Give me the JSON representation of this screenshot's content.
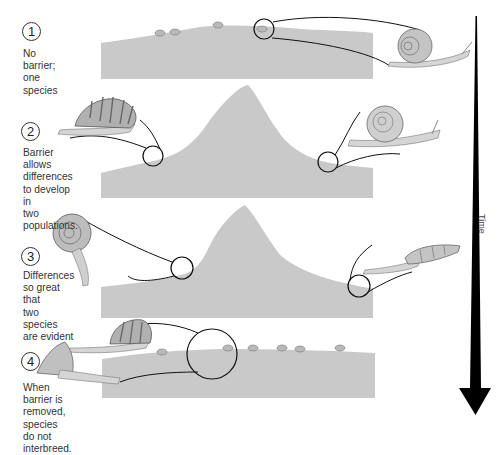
{
  "diagram": {
    "time_axis": {
      "label": "Time",
      "color": "#000000"
    },
    "colors": {
      "land": "#c9c9c9",
      "line": "#111111",
      "snail_shell": "#b5b5b5",
      "snail_body": "#d8d8d8"
    },
    "steps": [
      {
        "number": "1",
        "caption": "No barrier;\none species"
      },
      {
        "number": "2",
        "caption": "Barrier\nallows differences\nto develop in\ntwo populations."
      },
      {
        "number": "3",
        "caption": "Differences\nso great that\ntwo species\nare evident"
      },
      {
        "number": "4",
        "caption": "When barrier is\nremoved, species\ndo not interbreed."
      }
    ]
  }
}
